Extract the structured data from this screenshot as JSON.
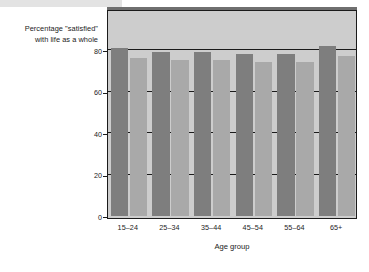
{
  "chart_data": {
    "type": "bar",
    "title": "",
    "xlabel": "Age group",
    "ylabel": "Percentage \"satisfied\" with life as a whole",
    "ylabel_line1": "Percentage \"satisfied\"",
    "ylabel_line2": "with life as a whole",
    "categories": [
      "15–24",
      "25–34",
      "35–44",
      "45–54",
      "55–64",
      "65+"
    ],
    "series": [
      {
        "name": "series-1",
        "color": "#7e7e7e",
        "values": [
          81,
          79,
          79,
          78,
          78,
          82
        ]
      },
      {
        "name": "series-2",
        "color": "#a9a9a9",
        "values": [
          76,
          75,
          75,
          74,
          74,
          77
        ]
      }
    ],
    "ylim": [
      0,
      96
    ],
    "yticks": [
      0,
      20,
      40,
      60,
      80
    ],
    "ytick_labels": [
      "0",
      "20",
      "40",
      "60",
      "80"
    ],
    "gridlines": [
      20,
      40,
      60,
      80
    ],
    "grid": true,
    "legend": "none",
    "plot_background": "#cdcdcd",
    "axis_color": "#1b1b1b"
  }
}
